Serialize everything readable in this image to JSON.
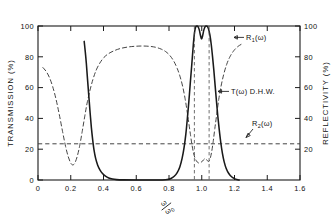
{
  "chart_data": {
    "type": "line",
    "title": "",
    "xlabel": "ω/ω₀",
    "ylabel": "TRANSMISSION  (%)",
    "y2label": "REFLECTIVITY  (%)",
    "xlim": [
      0,
      1.6
    ],
    "ylim": [
      0,
      100
    ],
    "y2lim": [
      0,
      100
    ],
    "grid": false,
    "legend_position": "inline-annotations",
    "xticks": [
      "0",
      "0.2",
      "0.4",
      "0.6",
      "0.8",
      "1.0",
      "1.2",
      "1.4",
      "1.6"
    ],
    "xtick_values": [
      0,
      0.2,
      0.4,
      0.6,
      0.8,
      1.0,
      1.2,
      1.4,
      1.6
    ],
    "yticks": [
      "0",
      "20",
      "40",
      "60",
      "80",
      "100"
    ],
    "ytick_values": [
      0,
      20,
      40,
      60,
      80,
      100
    ],
    "y2ticks": [
      "20",
      "40",
      "60",
      "80",
      "100"
    ],
    "y2tick_values": [
      20,
      40,
      60,
      80,
      100
    ],
    "annotations": [
      {
        "name": "R1-label",
        "text": "R",
        "sub": "1",
        "suffix": "(ω)",
        "x": 1.26,
        "y": 86
      },
      {
        "name": "T-label",
        "text": "T(ω)  D.H.W.",
        "x": 1.22,
        "y": 52
      },
      {
        "name": "R2-label",
        "text": "R",
        "sub": "2",
        "suffix": "(ω)",
        "x": 1.33,
        "y": 31
      }
    ],
    "vertical_markers": [
      0.955,
      1.045
    ],
    "series": [
      {
        "name": "T(ω) D.H.W.",
        "style": "solid",
        "axis": "left",
        "points": [
          [
            0.282,
            90.0
          ],
          [
            0.288,
            84.0
          ],
          [
            0.295,
            76.0
          ],
          [
            0.302,
            66.0
          ],
          [
            0.31,
            55.0
          ],
          [
            0.318,
            44.0
          ],
          [
            0.326,
            34.0
          ],
          [
            0.334,
            26.0
          ],
          [
            0.342,
            19.5
          ],
          [
            0.352,
            14.0
          ],
          [
            0.364,
            9.8
          ],
          [
            0.378,
            6.6
          ],
          [
            0.394,
            4.2
          ],
          [
            0.412,
            2.5
          ],
          [
            0.432,
            1.3
          ],
          [
            0.455,
            0.6
          ],
          [
            0.48,
            0.25
          ],
          [
            0.52,
            0.08
          ],
          [
            0.6,
            0.0
          ],
          [
            0.7,
            0.0
          ],
          [
            0.76,
            0.05
          ],
          [
            0.79,
            0.3
          ],
          [
            0.812,
            1.0
          ],
          [
            0.832,
            2.4
          ],
          [
            0.85,
            4.8
          ],
          [
            0.866,
            8.5
          ],
          [
            0.88,
            14.0
          ],
          [
            0.892,
            21.0
          ],
          [
            0.903,
            30.0
          ],
          [
            0.913,
            41.0
          ],
          [
            0.922,
            52.0
          ],
          [
            0.93,
            63.0
          ],
          [
            0.938,
            73.5
          ],
          [
            0.945,
            83.0
          ],
          [
            0.951,
            91.0
          ],
          [
            0.957,
            96.5
          ],
          [
            0.963,
            99.3
          ],
          [
            0.97,
            100.0
          ],
          [
            0.977,
            99.6
          ],
          [
            0.985,
            97.5
          ],
          [
            0.992,
            94.0
          ],
          [
            0.999,
            91.5
          ],
          [
            1.006,
            94.0
          ],
          [
            1.013,
            97.5
          ],
          [
            1.021,
            99.6
          ],
          [
            1.028,
            100.0
          ],
          [
            1.035,
            99.6
          ],
          [
            1.042,
            97.8
          ],
          [
            1.05,
            94.0
          ],
          [
            1.058,
            88.0
          ],
          [
            1.066,
            80.0
          ],
          [
            1.074,
            71.0
          ],
          [
            1.082,
            61.0
          ],
          [
            1.09,
            51.0
          ],
          [
            1.098,
            41.5
          ],
          [
            1.107,
            32.5
          ],
          [
            1.116,
            24.5
          ],
          [
            1.126,
            17.5
          ],
          [
            1.137,
            11.8
          ],
          [
            1.15,
            7.3
          ],
          [
            1.165,
            4.2
          ],
          [
            1.182,
            2.1
          ],
          [
            1.2,
            0.9
          ],
          [
            1.215,
            0.3
          ],
          [
            1.228,
            0.0
          ]
        ]
      },
      {
        "name": "R1(ω)",
        "style": "dashed",
        "axis": "right",
        "points": [
          [
            0.03,
            73.0
          ],
          [
            0.05,
            70.5
          ],
          [
            0.07,
            66.5
          ],
          [
            0.09,
            60.5
          ],
          [
            0.11,
            52.5
          ],
          [
            0.13,
            42.5
          ],
          [
            0.15,
            31.5
          ],
          [
            0.168,
            22.0
          ],
          [
            0.185,
            15.0
          ],
          [
            0.2,
            11.0
          ],
          [
            0.212,
            9.8
          ],
          [
            0.225,
            11.0
          ],
          [
            0.24,
            15.5
          ],
          [
            0.255,
            22.5
          ],
          [
            0.27,
            31.5
          ],
          [
            0.285,
            41.0
          ],
          [
            0.3,
            50.0
          ],
          [
            0.318,
            58.5
          ],
          [
            0.336,
            65.5
          ],
          [
            0.356,
            71.5
          ],
          [
            0.378,
            76.0
          ],
          [
            0.402,
            79.5
          ],
          [
            0.43,
            82.0
          ],
          [
            0.462,
            83.8
          ],
          [
            0.5,
            85.3
          ],
          [
            0.545,
            86.3
          ],
          [
            0.59,
            86.8
          ],
          [
            0.635,
            87.0
          ],
          [
            0.68,
            86.8
          ],
          [
            0.718,
            86.2
          ],
          [
            0.752,
            85.0
          ],
          [
            0.782,
            83.2
          ],
          [
            0.808,
            80.5
          ],
          [
            0.83,
            77.0
          ],
          [
            0.85,
            72.5
          ],
          [
            0.868,
            67.0
          ],
          [
            0.884,
            60.5
          ],
          [
            0.898,
            53.0
          ],
          [
            0.91,
            45.0
          ],
          [
            0.921,
            37.0
          ],
          [
            0.931,
            29.5
          ],
          [
            0.94,
            23.0
          ],
          [
            0.949,
            18.0
          ],
          [
            0.958,
            14.5
          ],
          [
            0.968,
            12.3
          ],
          [
            0.978,
            11.2
          ],
          [
            0.99,
            11.0
          ],
          [
            1.0,
            11.8
          ],
          [
            1.01,
            13.0
          ],
          [
            1.02,
            13.8
          ],
          [
            1.03,
            13.2
          ],
          [
            1.04,
            12.0
          ],
          [
            1.05,
            13.5
          ],
          [
            1.06,
            18.0
          ],
          [
            1.07,
            25.0
          ],
          [
            1.08,
            33.5
          ],
          [
            1.092,
            43.0
          ],
          [
            1.104,
            52.5
          ],
          [
            1.118,
            61.0
          ],
          [
            1.134,
            68.5
          ],
          [
            1.152,
            75.0
          ],
          [
            1.172,
            80.0
          ],
          [
            1.196,
            84.0
          ],
          [
            1.222,
            86.8
          ],
          [
            1.248,
            88.5
          ]
        ]
      },
      {
        "name": "R2(ω)",
        "style": "dashed-horizontal",
        "axis": "right",
        "constant": 23.5,
        "x_range": [
          0.0,
          1.6
        ]
      }
    ]
  }
}
